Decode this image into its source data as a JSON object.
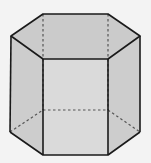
{
  "diagram": {
    "colors": {
      "background": "#f3f3f3",
      "top_face": "#cbcbcb",
      "front_face": "#dadada",
      "side_faces": "#cdcdcd",
      "edge": "#1a1a1a",
      "hidden_edge": "#555555"
    },
    "vertices": {
      "top": {
        "left": [
          11,
          36
        ],
        "back_left": [
          43,
          14
        ],
        "back_right": [
          108,
          14
        ],
        "right": [
          140,
          36
        ],
        "front_right": [
          108,
          59
        ],
        "front_left": [
          43,
          59
        ]
      },
      "bottom": {
        "left": [
          10,
          132
        ],
        "back_left": [
          43,
          110
        ],
        "back_right": [
          108,
          110
        ],
        "right": [
          140,
          132
        ],
        "front_right": [
          108,
          155
        ],
        "front_left": [
          43,
          155
        ]
      }
    }
  }
}
